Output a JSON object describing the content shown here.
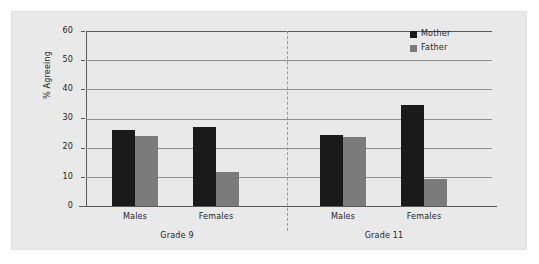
{
  "chart_data": {
    "type": "bar",
    "title": "",
    "subtitle": "",
    "xlabel": "",
    "ylabel": "% Agreeing",
    "ylim": [
      0,
      60
    ],
    "yticks": [
      0,
      10,
      20,
      30,
      40,
      50,
      60
    ],
    "ytick_labels": [
      "0",
      "10",
      "20",
      "30",
      "40",
      "50",
      "60"
    ],
    "grid": true,
    "legend_position": "top-right",
    "categories": [
      "Males",
      "Females",
      "Males",
      "Females"
    ],
    "group_labels": [
      "Grade 9",
      "Grade 11"
    ],
    "groups": [
      {
        "group": "Grade 9",
        "categories": [
          {
            "label": "Males",
            "mother": 26,
            "father": 24
          },
          {
            "label": "Females",
            "mother": 27,
            "father": 11.7
          }
        ]
      },
      {
        "group": "Grade 11",
        "categories": [
          {
            "label": "Males",
            "mother": 24.5,
            "father": 23.5
          },
          {
            "label": "Females",
            "mother": 34.5,
            "father": 9.3
          }
        ]
      }
    ],
    "series": [
      {
        "name": "Mother",
        "color": "#1a1a1a",
        "values": [
          26,
          27,
          24.5,
          34.5
        ]
      },
      {
        "name": "Father",
        "color": "#7a7a7a",
        "values": [
          24,
          11.7,
          23.5,
          9.3
        ]
      }
    ],
    "legend": [
      {
        "label": "Mother",
        "color": "#1a1a1a"
      },
      {
        "label": "Father",
        "color": "#7a7a7a"
      }
    ],
    "colors": {
      "panel_background": "#e9e9e9",
      "page_background": "#ffffff",
      "axis": "#5a5a5a",
      "gridline": "#8f8f8f",
      "text": "#231f20",
      "divider": "#9a9a9a"
    },
    "annotations": [
      {
        "type": "divider",
        "style": "dashed",
        "between": [
          "Grade 9",
          "Grade 11"
        ]
      }
    ]
  },
  "ytick_labels": {
    "t0": "0",
    "t1": "10",
    "t2": "20",
    "t3": "30",
    "t4": "40",
    "t5": "50",
    "t6": "60"
  },
  "axis": {
    "y_title": "% Agreeing"
  },
  "category_labels": {
    "g9_males": "Males",
    "g9_females": "Females",
    "g11_males": "Males",
    "g11_females": "Females"
  },
  "group_labels": {
    "grade9": "Grade 9",
    "grade11": "Grade 11"
  },
  "legend": {
    "mother": "Mother",
    "father": "Father"
  }
}
